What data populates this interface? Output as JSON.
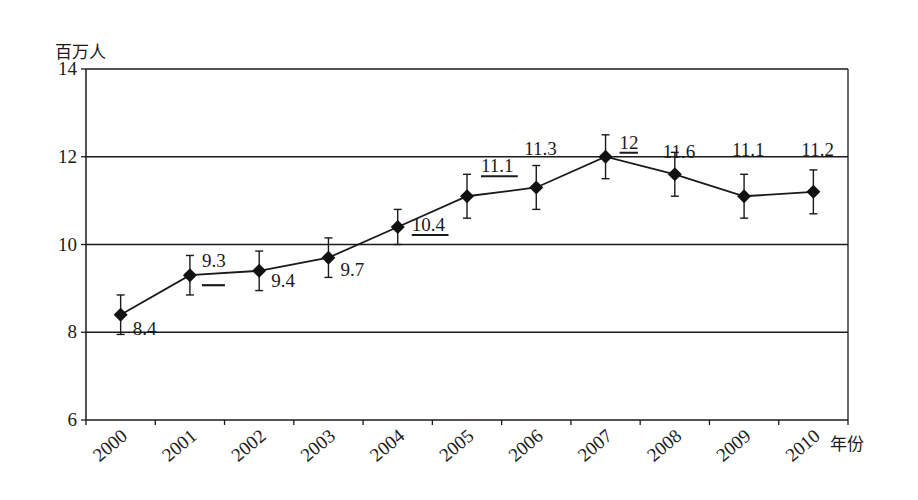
{
  "chart_data": {
    "type": "line",
    "title": "",
    "ylabel": "百万人",
    "xlabel": "年份",
    "ylim": [
      6,
      14
    ],
    "yticks": [
      6,
      8,
      10,
      12,
      14
    ],
    "grid": "horizontal",
    "legend": null,
    "categories": [
      "2000",
      "2001",
      "2002",
      "2003",
      "2004",
      "2005",
      "2006",
      "2007",
      "2008",
      "2009",
      "2010"
    ],
    "series": [
      {
        "name": "百万人",
        "marker": "diamond",
        "values": [
          8.4,
          9.3,
          9.4,
          9.7,
          10.4,
          11.1,
          11.3,
          12,
          11.6,
          11.1,
          11.2
        ],
        "error_bars": [
          0.45,
          0.45,
          0.45,
          0.45,
          0.4,
          0.5,
          0.5,
          0.5,
          0.5,
          0.5,
          0.5
        ],
        "data_labels": [
          "8.4",
          "9.3",
          "9.4",
          "9.7",
          "10.4",
          "11.1",
          "11.3",
          "12",
          "11.6",
          "11.1",
          "11.2"
        ],
        "underlined_labels": [
          "10.4",
          "11.1",
          "12"
        ]
      }
    ],
    "annotations": [
      {
        "type": "short-dash",
        "near": "2001",
        "description": "short horizontal dash below 9.3 label"
      }
    ]
  }
}
